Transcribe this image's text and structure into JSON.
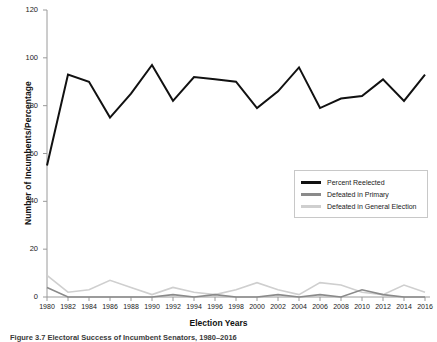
{
  "figure": {
    "caption": "Figure 3.7   Electoral Success of Incumbent Senators, 1980–2016"
  },
  "axes": {
    "ylabel": "Number of Incumbents/Percentage",
    "xlabel": "Election Years",
    "y_ticks": [
      "0",
      "20",
      "40",
      "60",
      "80",
      "100",
      "120"
    ],
    "x_ticks": [
      "1980",
      "1982",
      "1984",
      "1986",
      "1988",
      "1990",
      "1992",
      "1994",
      "1996",
      "1998",
      "2000",
      "2002",
      "2004",
      "2006",
      "2008",
      "2010",
      "2012",
      "2014",
      "2016"
    ]
  },
  "legend": {
    "items": [
      {
        "label": "Percent Reelected",
        "color": "#111111"
      },
      {
        "label": "Defeated in Primary",
        "color": "#8a8a8a"
      },
      {
        "label": "Defeated in General Election",
        "color": "#cfcfcf"
      }
    ]
  },
  "chart_data": {
    "type": "line",
    "title": "Electoral Success of Incumbent Senators, 1980–2016",
    "xlabel": "Election Years",
    "ylabel": "Number of Incumbents/Percentage",
    "x": [
      1980,
      1982,
      1984,
      1986,
      1988,
      1990,
      1992,
      1994,
      1996,
      1998,
      2000,
      2002,
      2004,
      2006,
      2008,
      2010,
      2012,
      2014,
      2016
    ],
    "categories": [
      "1980",
      "1982",
      "1984",
      "1986",
      "1988",
      "1990",
      "1992",
      "1994",
      "1996",
      "1998",
      "2000",
      "2002",
      "2004",
      "2006",
      "2008",
      "2010",
      "2012",
      "2014",
      "2016"
    ],
    "xlim": [
      1980,
      2016
    ],
    "ylim": [
      0,
      120
    ],
    "grid": false,
    "legend_position": "center-right",
    "series": [
      {
        "name": "Percent Reelected",
        "color": "#111111",
        "values": [
          55,
          93,
          90,
          75,
          85,
          97,
          82,
          92,
          91,
          90,
          79,
          86,
          96,
          79,
          83,
          84,
          91,
          82,
          93
        ]
      },
      {
        "name": "Defeated in Primary",
        "color": "#8a8a8a",
        "values": [
          4,
          0,
          0,
          0,
          0,
          0,
          1,
          0,
          1,
          0,
          0,
          1,
          0,
          1,
          0,
          3,
          1,
          0,
          0
        ]
      },
      {
        "name": "Defeated in General Election",
        "color": "#cfcfcf",
        "values": [
          9,
          2,
          3,
          7,
          4,
          1,
          4,
          2,
          1,
          3,
          6,
          3,
          1,
          6,
          5,
          2,
          1,
          5,
          2
        ]
      }
    ]
  }
}
